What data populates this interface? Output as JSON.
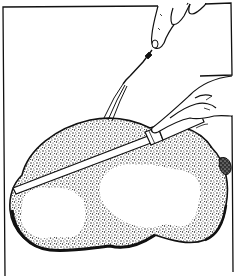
{
  "illustration": {
    "subject": "Carving a roast with a fork and knife",
    "style": "black-and-white stippled line drawing",
    "colors": {
      "ink": "#111111",
      "paper": "#ffffff"
    },
    "elements": [
      "frame-border",
      "roast",
      "carving-fork",
      "carving-knife",
      "upper-hand",
      "lower-hand",
      "roast-cut-faces",
      "string-tie"
    ]
  }
}
